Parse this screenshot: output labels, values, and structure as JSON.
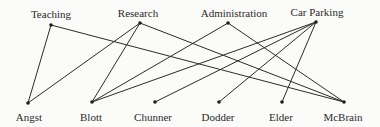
{
  "diagram": {
    "type": "bipartite-graph",
    "top_nodes": [
      {
        "id": "teaching",
        "label": "Teaching",
        "x": 51,
        "y": 25,
        "lx": 51,
        "ly": 8
      },
      {
        "id": "research",
        "label": "Research",
        "x": 140,
        "y": 23,
        "lx": 138,
        "ly": 7
      },
      {
        "id": "administration",
        "label": "Administration",
        "x": 228,
        "y": 23,
        "lx": 234,
        "ly": 7
      },
      {
        "id": "car_parking",
        "label": "Car Parking",
        "x": 316,
        "y": 22,
        "lx": 317,
        "ly": 6
      }
    ],
    "bottom_nodes": [
      {
        "id": "angst",
        "label": "Angst",
        "x": 28,
        "y": 103,
        "lx": 29,
        "ly": 111
      },
      {
        "id": "blott",
        "label": "Blott",
        "x": 92,
        "y": 102,
        "lx": 91,
        "ly": 111
      },
      {
        "id": "chunner",
        "label": "Chunner",
        "x": 155,
        "y": 102,
        "lx": 153,
        "ly": 111
      },
      {
        "id": "dodder",
        "label": "Dodder",
        "x": 219,
        "y": 102,
        "lx": 218,
        "ly": 111
      },
      {
        "id": "elder",
        "label": "Elder",
        "x": 282,
        "y": 102,
        "lx": 281,
        "ly": 111
      },
      {
        "id": "mcbrain",
        "label": "McBrain",
        "x": 344,
        "y": 102,
        "lx": 343,
        "ly": 111
      }
    ],
    "edges": [
      [
        "teaching",
        "angst"
      ],
      [
        "teaching",
        "mcbrain"
      ],
      [
        "research",
        "angst"
      ],
      [
        "research",
        "blott"
      ],
      [
        "research",
        "mcbrain"
      ],
      [
        "administration",
        "blott"
      ],
      [
        "administration",
        "mcbrain"
      ],
      [
        "car_parking",
        "blott"
      ],
      [
        "car_parking",
        "chunner"
      ],
      [
        "car_parking",
        "dodder"
      ],
      [
        "car_parking",
        "elder"
      ]
    ],
    "colors": {
      "line": "#2b2b2b",
      "node": "#1e1e1e",
      "text": "#2a2a2a",
      "background": "#fbfbf9"
    }
  }
}
